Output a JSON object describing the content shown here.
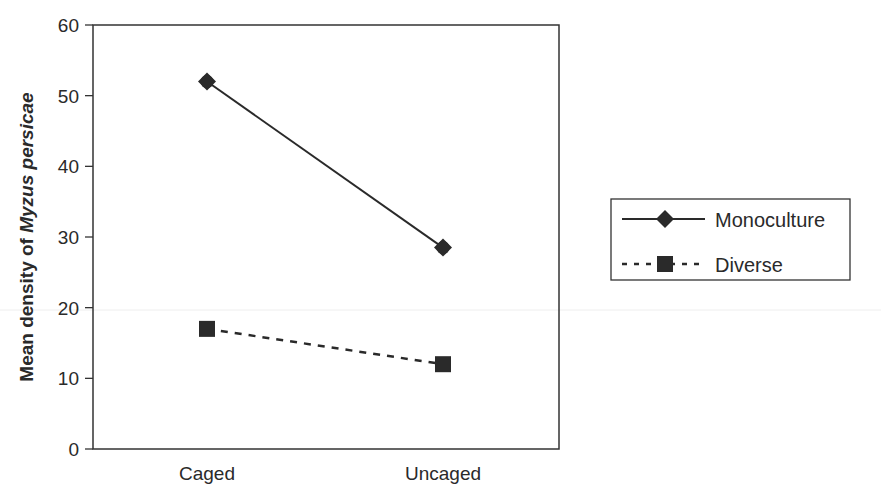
{
  "chart_data": {
    "type": "line",
    "title": "",
    "xlabel": "",
    "ylabel": "Mean density of Myzus persicae",
    "ylabel_parts": {
      "prefix": "Mean density of ",
      "italic": "Myzus persicae"
    },
    "categories": [
      "Caged",
      "Uncaged"
    ],
    "ylim": [
      0,
      60
    ],
    "yticks": [
      0,
      10,
      20,
      30,
      40,
      50,
      60
    ],
    "grid": false,
    "legend_position": "right",
    "series": [
      {
        "name": "Monoculture",
        "values": [
          52,
          28.5
        ],
        "line_style": "solid",
        "marker": "diamond",
        "color": "#2a2a2a"
      },
      {
        "name": "Diverse",
        "values": [
          17,
          12
        ],
        "line_style": "dashed",
        "marker": "square",
        "color": "#2a2a2a"
      }
    ]
  },
  "legend": {
    "items": [
      {
        "label": "Monoculture"
      },
      {
        "label": "Diverse"
      }
    ]
  }
}
